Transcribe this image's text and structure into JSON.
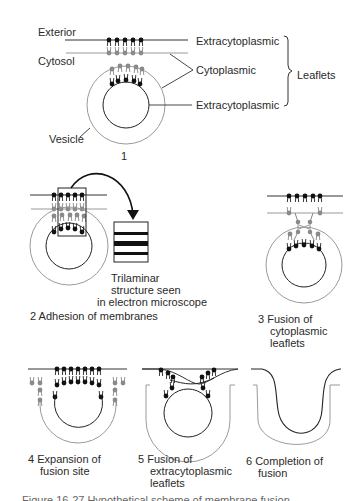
{
  "panel1": {
    "labels": {
      "exterior": "Exterior",
      "cytosol": "Cytosol",
      "vesicle": "Vesicle",
      "extracytoplasmic_top": "Extracytoplasmic",
      "cytoplasmic": "Cytoplasmic",
      "extracytoplasmic_bottom": "Extracytoplasmic",
      "leaflets": "Leaflets"
    },
    "number": "1"
  },
  "panel2": {
    "callout": {
      "line1": "Trilaminar",
      "line2": "structure seen",
      "line3": "in electron microscope"
    },
    "caption": "2 Adhesion of membranes"
  },
  "panel3": {
    "caption_line1": "3 Fusion of",
    "caption_line2": "cytoplasmic",
    "caption_line3": "leaflets"
  },
  "panel4": {
    "caption_line1": "4 Expansion of",
    "caption_line2": "fusion site"
  },
  "panel5": {
    "caption_line1": "5 Fusion of",
    "caption_line2": "extracytoplasmic",
    "caption_line3": "leaflets"
  },
  "panel6": {
    "caption_line1": "6 Completion of",
    "caption_line2": "fusion"
  },
  "figure_caption": "Figure 16-27  Hypothetical scheme of membrane fusion",
  "colors": {
    "ink": "#1a1a1a",
    "grey_leaflet": "#8a8a8a",
    "outline": "#9a9a9a"
  }
}
